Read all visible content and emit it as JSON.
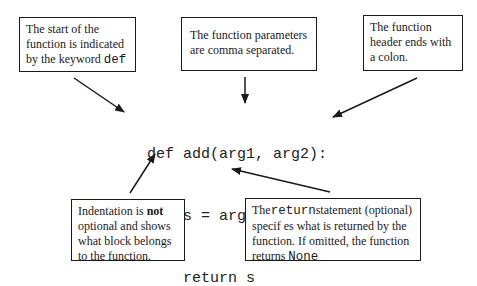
{
  "code": {
    "lines": [
      "def add(arg1, arg2):",
      "    s = arg1 + arg2",
      "    return s"
    ]
  },
  "annotations": {
    "def_keyword": {
      "text_before": "The start of the function is indicated by the keyword ",
      "code": "def"
    },
    "parameters": {
      "text": "The function parameters are comma separated."
    },
    "colon": {
      "text": "The function header ends with a colon."
    },
    "indentation": {
      "text_before": "Indentation is ",
      "bold": "not",
      "text_after": " optional and shows what block belongs to the function."
    },
    "return_statement": {
      "text_before": "The",
      "code": "return",
      "text_middle": "statement (optional) specif es what is returned by the function. If omitted, the function returns ",
      "code_end": "None"
    }
  },
  "colors": {
    "stroke": "#1a1a1a",
    "background": "#ffffff"
  }
}
